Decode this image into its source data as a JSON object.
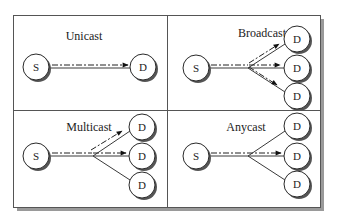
{
  "diagram": {
    "panels": [
      {
        "id": "unicast",
        "title": "Unicast",
        "source_label": "S",
        "destination_labels": [
          "D"
        ],
        "delivered_to": [
          0
        ]
      },
      {
        "id": "broadcast",
        "title": "Broadcast",
        "source_label": "S",
        "destination_labels": [
          "D",
          "D",
          "D"
        ],
        "delivered_to": [
          0,
          1,
          2
        ]
      },
      {
        "id": "multicast",
        "title": "Multicast",
        "source_label": "S",
        "destination_labels": [
          "D",
          "D",
          "D"
        ],
        "delivered_to": [
          0,
          1
        ]
      },
      {
        "id": "anycast",
        "title": "Anycast",
        "source_label": "S",
        "destination_labels": [
          "D",
          "D",
          "D"
        ],
        "delivered_to": [
          1
        ]
      }
    ]
  }
}
